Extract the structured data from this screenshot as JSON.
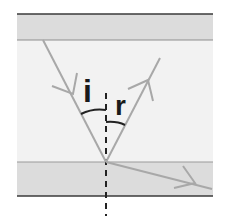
{
  "diagram": {
    "type": "light-ray-reflection-refraction",
    "labels": {
      "incidence_angle": "i",
      "reflection_angle": "r"
    },
    "colors": {
      "background": "#ffffff",
      "band_fill": "#dcdcdc",
      "middle_fill": "#f1f1f1",
      "outer_boundary": "#3a3a3a",
      "inner_boundary": "#9a9a9a",
      "ray": "#a8a8a8",
      "normal": "#222222",
      "arc": "#222222"
    },
    "elements": [
      "upper medium band",
      "middle medium",
      "lower medium band",
      "incident ray with arrow",
      "reflected ray with arrow",
      "refracted ray with arrow",
      "dashed normal line",
      "angle arcs"
    ]
  }
}
